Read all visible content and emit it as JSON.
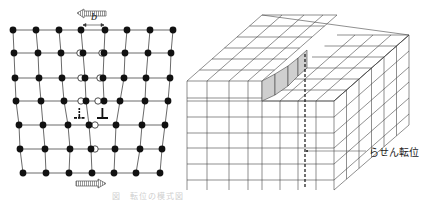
{
  "edge_dislocation": {
    "burgers_vector_label": "b",
    "top_arrow_direction": "left",
    "bottom_arrow_direction": "right",
    "rows": [
      {
        "y": 30,
        "atoms": [
          13,
          36,
          59,
          81,
          105,
          127,
          150,
          173
        ],
        "open": []
      },
      {
        "y": 53,
        "atoms": [
          14,
          38,
          61,
          83,
          104,
          125,
          148,
          171
        ],
        "open": [
          80,
          102
        ]
      },
      {
        "y": 78,
        "atoms": [
          15,
          39,
          62,
          85,
          103,
          124,
          146,
          170
        ],
        "open": [
          81,
          100
        ]
      },
      {
        "y": 101,
        "atoms": [
          16,
          41,
          64,
          86,
          104,
          120,
          145,
          168
        ],
        "open": [
          81,
          98
        ]
      },
      {
        "y": 125,
        "atoms": [
          19,
          43,
          68,
          89,
          116,
          142,
          165
        ],
        "open": [
          95
        ]
      },
      {
        "y": 149,
        "atoms": [
          20,
          45,
          70,
          91,
          115,
          140,
          162
        ],
        "open": [
          95
        ]
      },
      {
        "y": 173,
        "atoms": [
          23,
          46,
          69,
          92,
          114,
          136,
          160
        ],
        "open": []
      }
    ],
    "dislocation_symbols": [
      {
        "x": 79,
        "y": 116,
        "style": "dotted"
      },
      {
        "x": 102,
        "y": 116,
        "style": "solid"
      }
    ]
  },
  "screw_dislocation": {
    "label": "らせん転位"
  },
  "caption": "図　転位の模式図"
}
